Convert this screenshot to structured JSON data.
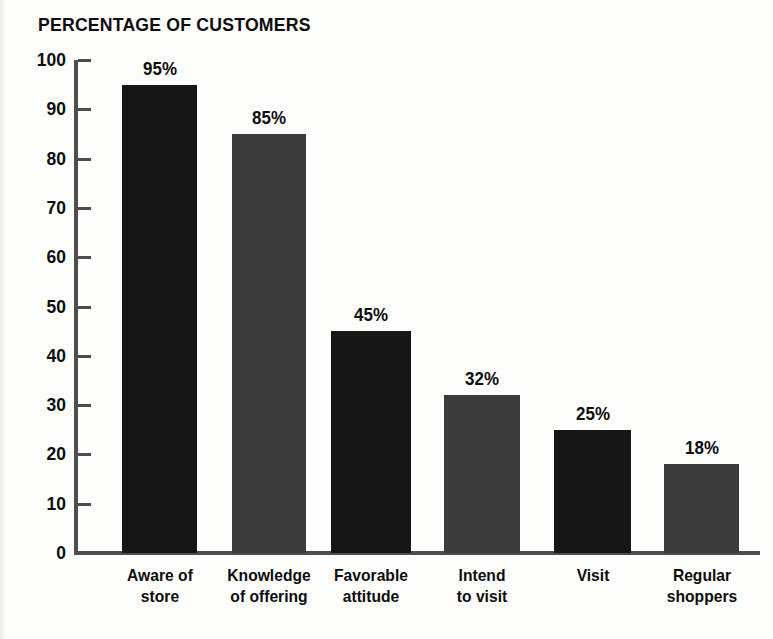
{
  "chart_data": {
    "type": "bar",
    "title": "PERCENTAGE OF CUSTOMERS",
    "xlabel": "",
    "ylabel": "",
    "ylim": [
      0,
      100
    ],
    "yticks": [
      0,
      10,
      20,
      30,
      40,
      50,
      60,
      70,
      80,
      90,
      100
    ],
    "grid": false,
    "legend": "none",
    "categories": [
      "Aware of store",
      "Knowledge of offering",
      "Favorable attitude",
      "Intend to visit",
      "Visit",
      "Regular shoppers"
    ],
    "category_lines": [
      [
        "Aware of",
        "store"
      ],
      [
        "Knowledge",
        "of offering"
      ],
      [
        "Favorable",
        "attitude"
      ],
      [
        "Intend",
        "to visit"
      ],
      [
        "Visit"
      ],
      [
        "Regular",
        "shoppers"
      ]
    ],
    "values": [
      95,
      85,
      45,
      32,
      25,
      18
    ],
    "data_labels": [
      "95%",
      "85%",
      "45%",
      "32%",
      "25%",
      "18%"
    ],
    "bar_colors": [
      "#161616",
      "#3b3b3b",
      "#161616",
      "#3b3b3b",
      "#161616",
      "#3b3b3b"
    ]
  },
  "colors": {
    "background": "#fdfdfc",
    "axis": "#4d4d4d",
    "text": "#0e0e0e",
    "bar_dark": "#161616",
    "bar_light": "#3b3b3b"
  }
}
